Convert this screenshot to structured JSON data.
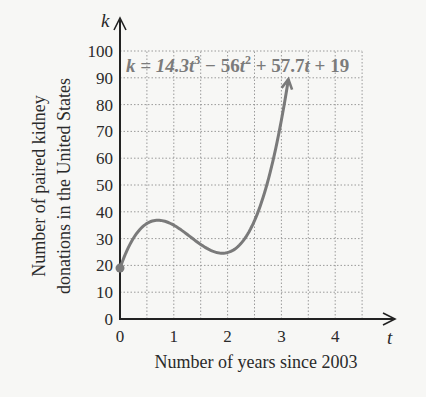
{
  "chart_data": {
    "type": "line",
    "title": "",
    "xlabel": "Number of years since 2003",
    "ylabel_line1": "Number of paired kidney",
    "ylabel_line2": "donations in the United States",
    "x_var": "t",
    "y_var": "k",
    "equation": "k = 14.3t³ − 56t² + 57.7t + 19",
    "equation_parts": {
      "lhs": "k = 14.3",
      "t1": "t",
      "sup1": "3",
      "mid1": " − 56",
      "t2": "t",
      "sup2": "2",
      "mid2": " + 57.7",
      "t3": "t",
      "tail": " + 19"
    },
    "coefficients": {
      "a": 14.3,
      "b": -56,
      "c": 57.7,
      "d": 19
    },
    "x_ticks": [
      "0",
      "1",
      "2",
      "3",
      "4"
    ],
    "y_ticks": [
      "0",
      "10",
      "20",
      "30",
      "40",
      "50",
      "60",
      "70",
      "80",
      "90",
      "100"
    ],
    "xlim": [
      0,
      4.5
    ],
    "ylim": [
      0,
      100
    ],
    "grid": true,
    "grid_step_x": 0.5,
    "grid_step_y": 10,
    "start_point": {
      "t": 0,
      "k": 19
    },
    "end_point": {
      "t": 3.13,
      "k": 85
    },
    "x": [
      0,
      0.25,
      0.5,
      0.75,
      1.0,
      1.25,
      1.5,
      1.75,
      2.0,
      2.25,
      2.5,
      2.75,
      3.0,
      3.13
    ],
    "values": [
      19,
      30.2,
      35.7,
      37.0,
      35.0,
      31.3,
      27.6,
      25.6,
      25.8,
      30.0,
      39.0,
      53.7,
      84.6,
      85
    ],
    "colors": {
      "curve": "#7a7a7a",
      "axis": "#222222",
      "grid": "#9a9a9a",
      "equation": "#7b7b7b"
    }
  }
}
